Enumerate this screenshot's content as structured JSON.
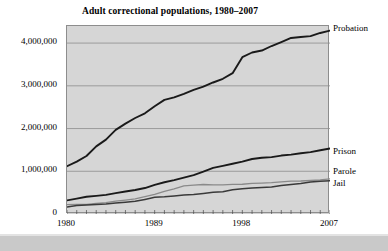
{
  "chart_data": {
    "type": "line",
    "title": "Adult correctional populations, 1980–2007",
    "xlabel": "",
    "ylabel": "",
    "xlim": [
      1980,
      2007
    ],
    "ylim": [
      0,
      4400000
    ],
    "grid": true,
    "legend_position": "right-of-line-ends",
    "y_ticks": [
      0,
      1000000,
      2000000,
      3000000,
      4000000
    ],
    "y_tick_labels": [
      "0",
      "1,000,000",
      "2,000,000",
      "3,000,000",
      "4,000,000"
    ],
    "x_ticks": [
      1980,
      1989,
      1998,
      2007
    ],
    "x_tick_labels": [
      "1980",
      "1989",
      "1998",
      "2007"
    ],
    "x_minor_tick_every_years": 1,
    "x": [
      1980,
      1981,
      1982,
      1983,
      1984,
      1985,
      1986,
      1987,
      1988,
      1989,
      1990,
      1991,
      1992,
      1993,
      1994,
      1995,
      1996,
      1997,
      1998,
      1999,
      2000,
      2001,
      2002,
      2003,
      2004,
      2005,
      2006,
      2007
    ],
    "series": [
      {
        "name": "Probation",
        "color": "#1a1a1a",
        "width": 1.9,
        "values": [
          1118097,
          1225934,
          1357264,
          1582947,
          1740948,
          1968712,
          2114621,
          2247158,
          2356483,
          2522125,
          2670234,
          2728472,
          2811611,
          2903061,
          2981022,
          3077861,
          3164996,
          3296513,
          3670441,
          3779922,
          3826209,
          3931731,
          4024067,
          4120012,
          4143792,
          4162536,
          4236800,
          4293163
        ]
      },
      {
        "name": "Prison",
        "color": "#1a1a1a",
        "width": 1.9,
        "values": [
          319598,
          360029,
          402914,
          423898,
          448264,
          487593,
          526436,
          562814,
          607766,
          683367,
          743382,
          792535,
          850566,
          909381,
          990147,
          1078542,
          1127528,
          1176564,
          1224469,
          1287172,
          1316333,
          1330007,
          1367547,
          1390279,
          1421345,
          1448344,
          1492973,
          1532817
        ]
      },
      {
        "name": "Parole",
        "color": "#8a8a8a",
        "width": 1.3,
        "values": [
          220438,
          225539,
          224604,
          246440,
          266992,
          300203,
          325638,
          355505,
          407977,
          456803,
          531407,
          590442,
          658601,
          676100,
          690371,
          679421,
          679733,
          694787,
          696385,
          714457,
          723898,
          732333,
          750934,
          769925,
          771852,
          784408,
          798202,
          824365
        ]
      },
      {
        "name": "Jail",
        "color": "#3a3a3a",
        "width": 1.5,
        "values": [
          163994,
          196785,
          209582,
          223551,
          234500,
          256615,
          274444,
          295873,
          341893,
          393303,
          403019,
          424129,
          441781,
          455500,
          479800,
          507044,
          518492,
          567079,
          592462,
          605943,
          621149,
          631240,
          665475,
          691301,
          713990,
          747529,
          765819,
          780581
        ]
      }
    ],
    "annotations": []
  },
  "series_labels": [
    {
      "label": "Probation",
      "top_px": 24
    },
    {
      "label": "Prison",
      "top_px": 147
    },
    {
      "label": "Parole",
      "top_px": 167
    },
    {
      "label": "Jail",
      "top_px": 179
    }
  ]
}
